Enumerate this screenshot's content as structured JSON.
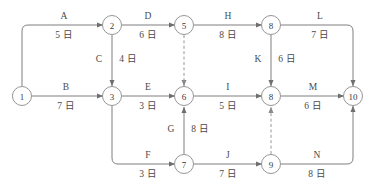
{
  "diagram": {
    "duration_unit": "日",
    "colors": {
      "background": "#ffffff",
      "edge": "#6f6f6f",
      "dummy_edge": "#8a8a8a",
      "node_stroke": "#8a8a8a",
      "text": "#4a4a4a"
    },
    "nodes": [
      {
        "id": "n1",
        "label": "1",
        "x": 22,
        "y": 96
      },
      {
        "id": "n2",
        "label": "2",
        "x": 112,
        "y": 25
      },
      {
        "id": "n3",
        "label": "3",
        "x": 112,
        "y": 96
      },
      {
        "id": "n5",
        "label": "5",
        "x": 184,
        "y": 25
      },
      {
        "id": "n6",
        "label": "6",
        "x": 184,
        "y": 96
      },
      {
        "id": "n7",
        "label": "7",
        "x": 184,
        "y": 164
      },
      {
        "id": "n8t",
        "label": "8",
        "x": 271,
        "y": 25
      },
      {
        "id": "n8m",
        "label": "8",
        "x": 271,
        "y": 96
      },
      {
        "id": "n9",
        "label": "9",
        "x": 271,
        "y": 164
      },
      {
        "id": "n10",
        "label": "10",
        "x": 353,
        "y": 96
      }
    ],
    "edges": [
      {
        "id": "A",
        "name": "A",
        "duration": "5 日",
        "from": "1",
        "to": "2",
        "style": "solid",
        "orientation": "horizontal"
      },
      {
        "id": "B",
        "name": "B",
        "duration": "7 日",
        "from": "1",
        "to": "3",
        "style": "solid",
        "orientation": "horizontal"
      },
      {
        "id": "C",
        "name": "C",
        "duration": "4 日",
        "from": "2",
        "to": "3",
        "style": "solid",
        "orientation": "vertical"
      },
      {
        "id": "D",
        "name": "D",
        "duration": "6 日",
        "from": "2",
        "to": "5",
        "style": "solid",
        "orientation": "horizontal"
      },
      {
        "id": "E",
        "name": "E",
        "duration": "3 日",
        "from": "3",
        "to": "6",
        "style": "solid",
        "orientation": "horizontal"
      },
      {
        "id": "F",
        "name": "F",
        "duration": "3 日",
        "from": "3",
        "to": "7",
        "style": "solid",
        "orientation": "horizontal"
      },
      {
        "id": "G",
        "name": "G",
        "duration": "8 日",
        "from": "7",
        "to": "6",
        "style": "solid",
        "orientation": "vertical"
      },
      {
        "id": "H",
        "name": "H",
        "duration": "8 日",
        "from": "5",
        "to": "8",
        "style": "solid",
        "orientation": "horizontal"
      },
      {
        "id": "I",
        "name": "I",
        "duration": "5 日",
        "from": "6",
        "to": "8",
        "style": "solid",
        "orientation": "horizontal"
      },
      {
        "id": "J",
        "name": "J",
        "duration": "7 日",
        "from": "7",
        "to": "9",
        "style": "solid",
        "orientation": "horizontal"
      },
      {
        "id": "K",
        "name": "K",
        "duration": "6 日",
        "from": "8",
        "to": "8",
        "style": "solid",
        "orientation": "vertical"
      },
      {
        "id": "L",
        "name": "L",
        "duration": "7 日",
        "from": "8",
        "to": "10",
        "style": "solid",
        "orientation": "horizontal"
      },
      {
        "id": "M",
        "name": "M",
        "duration": "6 日",
        "from": "8",
        "to": "10",
        "style": "solid",
        "orientation": "horizontal"
      },
      {
        "id": "N",
        "name": "N",
        "duration": "8 日",
        "from": "9",
        "to": "10",
        "style": "solid",
        "orientation": "horizontal"
      }
    ],
    "dummy_edges": [
      {
        "id": "dummy-5-6",
        "from": "5",
        "to": "6",
        "style": "dashed"
      },
      {
        "id": "dummy-9-8",
        "from": "9",
        "to": "8",
        "style": "dashed"
      }
    ]
  }
}
